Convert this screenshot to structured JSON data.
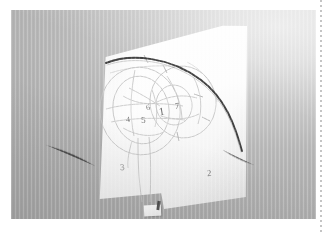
{
  "figure": {
    "kind": "photograph",
    "alt": "Photo of a white paper sheet with light pencil circles and handwritten region numbers"
  },
  "colors": {
    "page_background": "#ffffff",
    "photo_backdrop_light": "#e9e9e9",
    "photo_backdrop_dark": "#aeaeae",
    "paper": "#ffffff",
    "pencil_line": "#b9b9b9",
    "pencil_label": "#7d7d7d",
    "dark_arc": "#2e2e2e",
    "divider": "#b9b9b9"
  },
  "annotations": {
    "labels": [
      {
        "id": "label-1",
        "text": "1"
      },
      {
        "id": "label-2",
        "text": "2"
      },
      {
        "id": "label-3",
        "text": "3"
      },
      {
        "id": "label-4",
        "text": "4"
      },
      {
        "id": "label-5",
        "text": "5"
      },
      {
        "id": "label-6",
        "text": "6"
      },
      {
        "id": "label-7",
        "text": "7"
      }
    ]
  }
}
